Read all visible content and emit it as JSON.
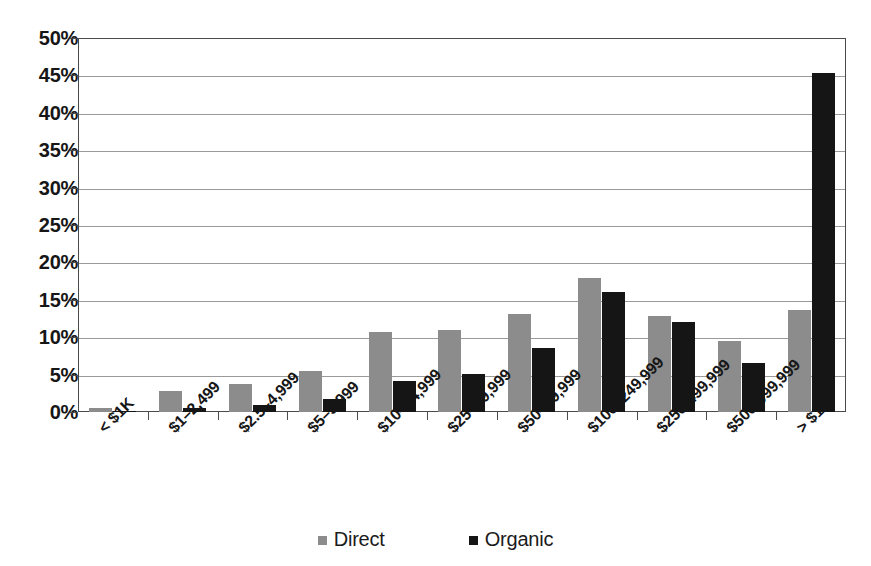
{
  "chart_data": {
    "type": "bar",
    "title": "",
    "subtitle": "",
    "xlabel": "",
    "ylabel": "",
    "ylim": [
      0,
      50
    ],
    "ytick_step": 5,
    "ytick_labels": [
      "0%",
      "5%",
      "10%",
      "15%",
      "20%",
      "25%",
      "30%",
      "35%",
      "40%",
      "45%",
      "50%"
    ],
    "ytick_values": [
      0,
      5,
      10,
      15,
      20,
      25,
      30,
      35,
      40,
      45,
      50
    ],
    "grid": true,
    "legend_position": "bottom",
    "value_unit": "%",
    "categories": [
      "< $1K",
      "$1–2,499",
      "$2.5–4,999",
      "$5–9,999",
      "$10–24,999",
      "$25–49,999",
      "$50–99,999",
      "$100–249,999",
      "$250-499,999",
      "$500-999,999",
      "> $1M"
    ],
    "series": [
      {
        "name": "Direct",
        "color": "#8c8c8c",
        "values": [
          0.6,
          2.8,
          3.8,
          5.5,
          10.7,
          10.9,
          13.1,
          17.9,
          12.9,
          9.5,
          13.6
        ]
      },
      {
        "name": "Organic",
        "color": "#151515",
        "values": [
          0.1,
          0.6,
          0.9,
          1.8,
          4.2,
          5.1,
          8.6,
          16.0,
          12.0,
          6.6,
          45.3
        ]
      }
    ]
  },
  "legend": {
    "items": [
      {
        "label": "Direct",
        "swatch": "legend-swatch-direct"
      },
      {
        "label": "Organic",
        "swatch": "legend-swatch-organic"
      }
    ]
  }
}
